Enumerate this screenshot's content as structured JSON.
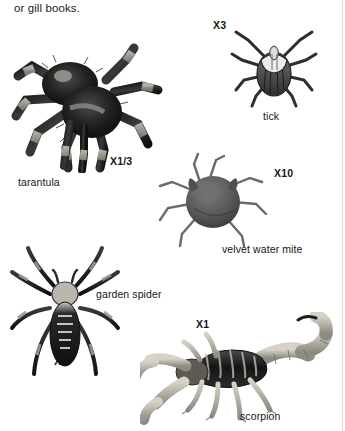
{
  "page": {
    "width": 345,
    "height": 431,
    "background": "#ffffff",
    "rule_color": "#d8d8d8"
  },
  "body_text": {
    "continuation_line": "or gill books."
  },
  "figures": [
    {
      "id": "tarantula",
      "name": "tarantula",
      "label": "tarantula",
      "magnification": "X1/3",
      "ink": "#1b1b1b"
    },
    {
      "id": "tick",
      "name": "tick",
      "label": "tick",
      "magnification": "X3",
      "ink": "#3a3a3a"
    },
    {
      "id": "velvet-water-mite",
      "name": "velvet water mite",
      "label": "velvet water mite",
      "magnification": "X10",
      "ink": "#555555"
    },
    {
      "id": "garden-spider",
      "name": "garden spider",
      "label": "garden spider",
      "magnification": "X1",
      "ink": "#242424"
    },
    {
      "id": "scorpion",
      "name": "scorpion",
      "label": "scorpion",
      "magnification": "X1",
      "ink": "#4a4a4a"
    }
  ]
}
